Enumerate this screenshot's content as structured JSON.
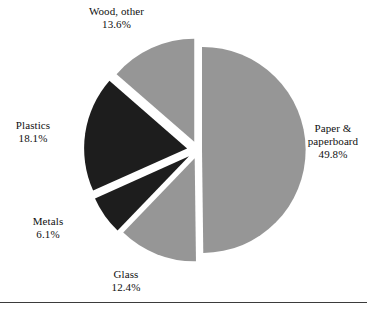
{
  "chart_data": {
    "type": "pie",
    "title": "",
    "subtitle": "",
    "xlabel": "",
    "ylabel": "",
    "legend_position": "none",
    "grid": false,
    "exploded": true,
    "labels_show_percent": true,
    "categories": [
      "Paper & paperboard",
      "Glass",
      "Metals",
      "Plastics",
      "Wood, other"
    ],
    "values": [
      49.8,
      12.4,
      6.1,
      18.1,
      13.6
    ],
    "value_suffix": "%",
    "slice_colors": [
      "#969696",
      "#969696",
      "#1d1d1d",
      "#1d1d1d",
      "#969696"
    ],
    "slices": [
      {
        "name": "Paper & paperboard",
        "label_line1": "Paper &",
        "label_line2": "paperboard",
        "value": 49.8,
        "value_text": "49.8%",
        "color": "#969696",
        "start_angle": -90,
        "end_angle": 89.28,
        "explode_angle": -0.36,
        "explode": 4
      },
      {
        "name": "Glass",
        "label_line1": "Glass",
        "label_line2": "",
        "value": 12.4,
        "value_text": "12.4%",
        "color": "#969696",
        "start_angle": 89.28,
        "end_angle": 133.92,
        "explode_angle": 111.6,
        "explode": 9
      },
      {
        "name": "Metals",
        "label_line1": "Metals",
        "label_line2": "",
        "value": 6.1,
        "value_text": "6.1%",
        "color": "#1d1d1d",
        "start_angle": 133.92,
        "end_angle": 155.88,
        "explode_angle": 144.9,
        "explode": 11
      },
      {
        "name": "Plastics",
        "label_line1": "Plastics",
        "label_line2": "",
        "value": 18.1,
        "value_text": "18.1%",
        "color": "#1d1d1d",
        "start_angle": 155.88,
        "end_angle": 221.04,
        "explode_angle": 188.46,
        "explode": 11
      },
      {
        "name": "Wood, other",
        "label_line1": "Wood, other",
        "label_line2": "",
        "value": 13.6,
        "value_text": "13.6%",
        "color": "#969696",
        "start_angle": 221.04,
        "end_angle": 270,
        "explode_angle": 245.52,
        "explode": 9
      }
    ],
    "geometry": {
      "center_x": 198,
      "center_y": 150,
      "radius": 103
    }
  },
  "labels": {
    "paper": {
      "line1": "Paper &",
      "line2": "paperboard",
      "value": "49.8%"
    },
    "wood": {
      "line1": "Wood, other",
      "value": "13.6%"
    },
    "plastics": {
      "line1": "Plastics",
      "value": "18.1%"
    },
    "metals": {
      "line1": "Metals",
      "value": "6.1%"
    },
    "glass": {
      "line1": "Glass",
      "value": "12.4%"
    }
  },
  "colors": {
    "gray_slice": "#969696",
    "dark_slice": "#1d1d1d",
    "background": "#ffffff",
    "rule": "#3b3b3b"
  }
}
